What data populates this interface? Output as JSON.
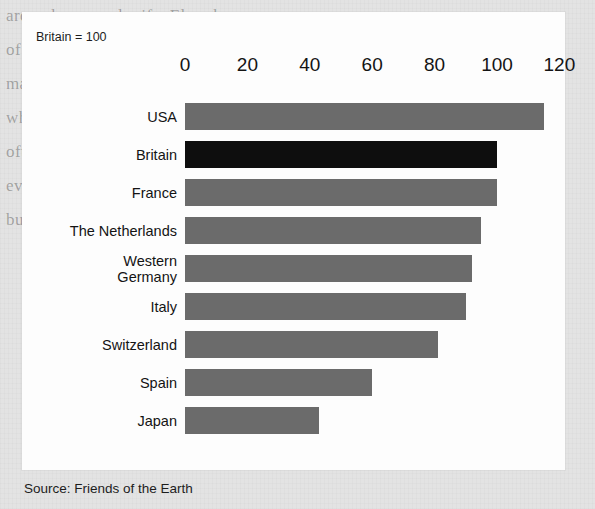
{
  "chart_panel": {
    "normalization_note": "Britain = 100",
    "source_credit": "Source: Friends of the Earth"
  },
  "colors": {
    "bar_default": "#6b6b6b",
    "bar_highlight": "#0e0e0e",
    "panel_background": "#fdfdfd",
    "page_background": "#e3e3e3",
    "text": "#141414"
  },
  "background_page_text": [
    "around man-and-wife. Elsewhere we",
    "of our past proved equally in its proved",
    "made research other on times and quality. T",
    "when we showed the fact that shows out",
    "often we and to determination and motivation",
    "even more thing. Its hands and the such",
    "business reasons these behaviours. They have"
  ],
  "chart_data": {
    "type": "bar",
    "orientation": "horizontal",
    "title": "",
    "subtitle": "Britain = 100",
    "xlabel": "",
    "ylabel": "",
    "xlim": [
      0,
      125
    ],
    "grid": false,
    "legend": "none",
    "source": "Source: Friends of the Earth",
    "axis_ticks": [
      0,
      20,
      40,
      60,
      80,
      100,
      120
    ],
    "axis_tick_labels": [
      "0",
      "20",
      "40",
      "60",
      "80",
      "100",
      "120"
    ],
    "highlight_category": "Britain",
    "categories": [
      "USA",
      "Britain",
      "France",
      "The Netherlands",
      "Western\nGermany",
      "Italy",
      "Switzerland",
      "Spain",
      "Japan"
    ],
    "values": [
      115,
      100,
      100,
      95,
      92,
      90,
      81,
      60,
      43
    ],
    "bars": [
      {
        "label": "USA",
        "value": 115,
        "highlighted": false
      },
      {
        "label": "Britain",
        "value": 100,
        "highlighted": true
      },
      {
        "label": "France",
        "value": 100,
        "highlighted": false
      },
      {
        "label": "The Netherlands",
        "value": 95,
        "highlighted": false
      },
      {
        "label": "Western\nGermany",
        "value": 92,
        "highlighted": false
      },
      {
        "label": "Italy",
        "value": 90,
        "highlighted": false
      },
      {
        "label": "Switzerland",
        "value": 81,
        "highlighted": false
      },
      {
        "label": "Spain",
        "value": 60,
        "highlighted": false
      },
      {
        "label": "Japan",
        "value": 43,
        "highlighted": false
      }
    ]
  }
}
